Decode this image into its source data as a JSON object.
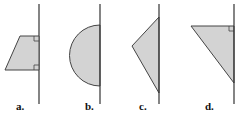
{
  "figure": {
    "panels": [
      {
        "id": "a",
        "label": "a.",
        "shape": "trapezoid",
        "right_angles": 2
      },
      {
        "id": "b",
        "label": "b.",
        "shape": "semicircle",
        "right_angles": 0
      },
      {
        "id": "c",
        "label": "c.",
        "shape": "triangle",
        "right_angles": 0
      },
      {
        "id": "d",
        "label": "d.",
        "shape": "right-triangle",
        "right_angles": 1
      }
    ],
    "colors": {
      "fill": "#d3d3d3",
      "stroke": "#444444",
      "axis": "#333333"
    }
  }
}
